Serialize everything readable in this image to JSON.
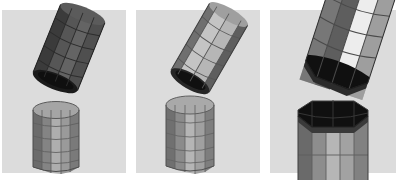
{
  "figure": {
    "name": "three-panel-3d-octagonal-cylinder-assembly-sequence",
    "width": 404,
    "height": 183,
    "outer_background": "#ffffff",
    "panel_background": "#dcdcdc",
    "panel_count": 3,
    "top_margin": 10,
    "bottom_margin": 8,
    "panel_gap": 6,
    "panel_width": 128
  },
  "panels": [
    {
      "id": "panel-1",
      "label": "Panel 1",
      "order": 1,
      "stage": "far",
      "background": "#dcdcdc",
      "objects": [
        {
          "name": "tilted-cap-cylinder",
          "role": "upper-tilted-cylinder",
          "shape": "octagonal-prism",
          "tilt_deg": 22,
          "shading": "dark",
          "face_grid_rows": 5,
          "face_grid_cols": 4,
          "colors": {
            "light": "#6e6e6e",
            "mid": "#555555",
            "dark": "#3b3b3b",
            "darkest": "#262626",
            "opening": "#151515",
            "edge": "#2a2a2a"
          }
        },
        {
          "name": "base-container-cylinder",
          "role": "lower-standing-cylinder",
          "shape": "octagonal-prism",
          "tilt_deg": 0,
          "shading": "mid",
          "face_grid_rows": 5,
          "face_grid_cols": 5,
          "capped": true,
          "colors": {
            "top": "#a3a3a3",
            "light": "#b4b4b4",
            "mid": "#8f8f8f",
            "dark": "#6f6f6f",
            "darkest": "#4a4a4a",
            "edge": "#5a5a5a"
          }
        }
      ]
    },
    {
      "id": "panel-2",
      "label": "Panel 2",
      "order": 2,
      "stage": "mid",
      "background": "#dcdcdc",
      "objects": [
        {
          "name": "tilted-cap-cylinder",
          "role": "upper-tilted-cylinder",
          "shape": "octagonal-prism",
          "tilt_deg": 30,
          "shading": "light",
          "face_grid_rows": 5,
          "face_grid_cols": 3,
          "colors": {
            "light": "#c6c6c6",
            "mid": "#a8a8a8",
            "dark": "#6b6b6b",
            "darkest": "#3d3d3d",
            "opening": "#141414",
            "edge": "#4e4e4e"
          }
        },
        {
          "name": "base-container-cylinder",
          "role": "lower-standing-cylinder",
          "shape": "octagonal-prism",
          "tilt_deg": 0,
          "shading": "mid",
          "face_grid_rows": 5,
          "face_grid_cols": 5,
          "capped": true,
          "colors": {
            "top": "#a8a8a8",
            "light": "#bcbcbc",
            "mid": "#969696",
            "dark": "#767676",
            "darkest": "#4f4f4f",
            "edge": "#5f5f5f"
          }
        }
      ]
    },
    {
      "id": "panel-3",
      "label": "Panel 3",
      "order": 3,
      "stage": "near",
      "background": "#dcdcdc",
      "objects": [
        {
          "name": "tilted-cap-cylinder",
          "role": "upper-tilted-cylinder",
          "shape": "octagonal-prism",
          "tilt_deg": 18,
          "shading": "high-contrast",
          "face_grid_rows": 4,
          "face_grid_cols": 4,
          "open_end_visible": true,
          "colors": {
            "highlight": "#ededed",
            "light": "#c9c9c9",
            "mid": "#9a9a9a",
            "dark": "#6a6a6a",
            "darkest": "#3a3a3a",
            "opening": "#101010",
            "edge": "#2f2f2f"
          }
        },
        {
          "name": "open-base-container",
          "role": "lower-open-container",
          "shape": "octagonal-prism-open",
          "tilt_deg": 0,
          "shading": "mid",
          "face_grid_rows": 3,
          "face_grid_cols": 5,
          "capped": false,
          "colors": {
            "interior": "#101010",
            "rim": "#2b2b2b",
            "light": "#b8b8b8",
            "mid": "#9a9a9a",
            "dark": "#6d6d6d",
            "darkest": "#3f3f3f",
            "edge": "#5a5a5a"
          }
        }
      ]
    }
  ]
}
